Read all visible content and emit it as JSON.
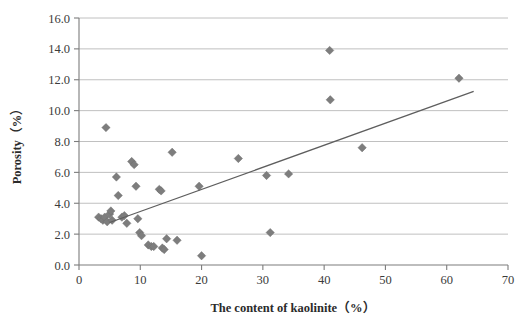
{
  "chart_data": {
    "type": "scatter",
    "title": "",
    "xlabel": "The content of kaolinite（%）",
    "ylabel": "Porosity（%）",
    "xlim": [
      0,
      70
    ],
    "ylim": [
      0,
      16
    ],
    "xticks": [
      "0",
      "10",
      "20",
      "30",
      "40",
      "50",
      "60",
      "70"
    ],
    "xtick_values": [
      0,
      10,
      20,
      30,
      40,
      50,
      60,
      70
    ],
    "yticks": [
      "0.0",
      "2.0",
      "4.0",
      "6.0",
      "8.0",
      "10.0",
      "12.0",
      "14.0",
      "16.0"
    ],
    "ytick_values": [
      0,
      2,
      4,
      6,
      8,
      10,
      12,
      14,
      16
    ],
    "grid": "horizontal",
    "legend": "none",
    "marker_shape": "diamond",
    "marker_color": "#7d7d7d",
    "trendline_color": "#5e5e5e",
    "series": [
      {
        "name": "Porosity vs kaolinite content",
        "points": [
          [
            3.2,
            3.1
          ],
          [
            3.6,
            3.0
          ],
          [
            3.9,
            2.9
          ],
          [
            4.2,
            3.1
          ],
          [
            4.4,
            8.9
          ],
          [
            4.6,
            2.8
          ],
          [
            5.0,
            3.3
          ],
          [
            5.2,
            3.5
          ],
          [
            5.4,
            2.9
          ],
          [
            6.1,
            5.7
          ],
          [
            6.4,
            4.5
          ],
          [
            7.0,
            3.1
          ],
          [
            7.4,
            3.2
          ],
          [
            7.8,
            2.7
          ],
          [
            8.6,
            6.7
          ],
          [
            9.0,
            6.5
          ],
          [
            9.3,
            5.1
          ],
          [
            9.6,
            3.0
          ],
          [
            9.9,
            2.1
          ],
          [
            10.2,
            1.9
          ],
          [
            11.3,
            1.3
          ],
          [
            11.8,
            1.2
          ],
          [
            12.2,
            1.2
          ],
          [
            13.1,
            4.9
          ],
          [
            13.4,
            4.8
          ],
          [
            13.6,
            1.1
          ],
          [
            13.9,
            1.0
          ],
          [
            14.3,
            1.7
          ],
          [
            15.2,
            7.3
          ],
          [
            16.0,
            1.6
          ],
          [
            19.6,
            5.1
          ],
          [
            20.0,
            0.6
          ],
          [
            26.0,
            6.9
          ],
          [
            30.6,
            5.8
          ],
          [
            31.2,
            2.1
          ],
          [
            34.2,
            5.9
          ],
          [
            40.9,
            13.9
          ],
          [
            41.0,
            10.7
          ],
          [
            46.2,
            7.6
          ],
          [
            62.0,
            12.1
          ]
        ]
      }
    ],
    "trendline": {
      "x0": 5.0,
      "y0": 2.75,
      "x1": 64.4,
      "y1": 11.25
    }
  }
}
